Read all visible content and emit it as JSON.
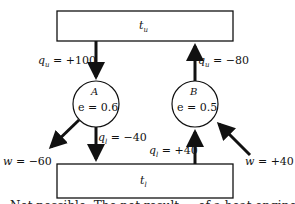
{
  "diagram": {
    "reservoirs": {
      "top": {
        "label": "t",
        "subscript": "u"
      },
      "bottom": {
        "label": "t",
        "subscript": "l"
      }
    },
    "engines": [
      {
        "name": "A",
        "efficiency_label": "e = 0.6"
      },
      {
        "name": "B",
        "efficiency_label": "e = 0.5"
      }
    ],
    "flows": {
      "qu_A": {
        "symbol": "q",
        "sub": "u",
        "value": " = +100"
      },
      "qu_B": {
        "symbol": "q",
        "sub": "u",
        "value": " = −80"
      },
      "ql_A": {
        "symbol": "q",
        "sub": "l",
        "value": " = −40"
      },
      "ql_B": {
        "symbol": "q",
        "sub": "l",
        "value": " = +40"
      },
      "w_A": {
        "symbol": "w",
        "value": " = −60"
      },
      "w_B": {
        "symbol": "w",
        "value": " = +40"
      }
    },
    "caption_partial": "Not possible. The net result ... of a heat engine"
  }
}
